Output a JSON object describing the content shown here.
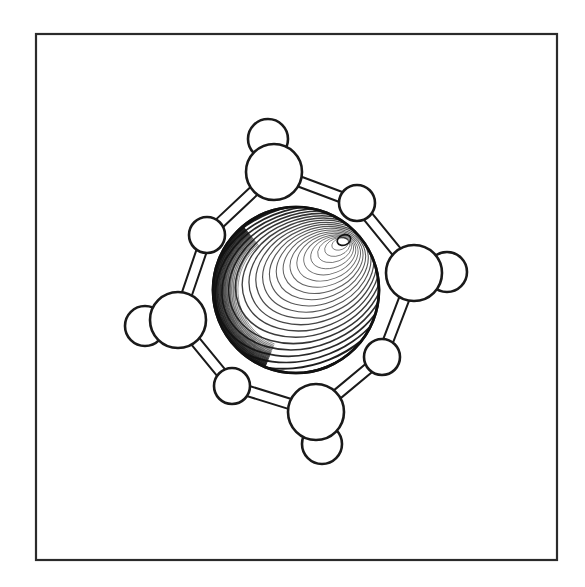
{
  "figure": {
    "kind": "molecular-structure-line-drawing",
    "caption": "",
    "canvas": {
      "width": 585,
      "height": 587,
      "background": "#ffffff"
    },
    "frame": {
      "x": 36,
      "y": 34,
      "width": 521,
      "height": 526,
      "stroke": "#2b2b2b",
      "stroke_width": 2.2,
      "fill": "none"
    },
    "style": {
      "line_color": "#1a1a1a",
      "atom_fill": "#ffffff",
      "atom_stroke_width": 2.6,
      "bond_stroke_width": 2.0,
      "hatch_color": "#111111"
    },
    "central_atom": {
      "label": "central-metal-sphere",
      "cx": 296,
      "cy": 290,
      "r": 83,
      "fill": "#ffffff",
      "stroke": "#111111",
      "stroke_width": 2.6,
      "highlight": {
        "cx": 344,
        "cy": 240,
        "rx": 7,
        "ry": 5
      },
      "shading": {
        "type": "concentric-contour-hatching",
        "rings": 22,
        "tilt_deg": -22,
        "dark_quadrant": "lower-left"
      }
    },
    "ring_atoms": [
      {
        "id": "N-top",
        "type": "large",
        "cx": 274,
        "cy": 172,
        "r": 28
      },
      {
        "id": "O-upper-right",
        "type": "small",
        "cx": 357,
        "cy": 203,
        "r": 18
      },
      {
        "id": "N-right",
        "type": "large",
        "cx": 414,
        "cy": 273,
        "r": 28
      },
      {
        "id": "O-lower-right",
        "type": "small",
        "cx": 382,
        "cy": 357,
        "r": 18
      },
      {
        "id": "N-bottom",
        "type": "large",
        "cx": 316,
        "cy": 412,
        "r": 28
      },
      {
        "id": "O-lower-left",
        "type": "small",
        "cx": 232,
        "cy": 386,
        "r": 18
      },
      {
        "id": "N-left",
        "type": "large",
        "cx": 178,
        "cy": 320,
        "r": 28
      },
      {
        "id": "O-upper-left",
        "type": "small",
        "cx": 207,
        "cy": 235,
        "r": 18
      }
    ],
    "hydrogen_atoms": [
      {
        "id": "H-top",
        "parent": "N-top",
        "cx": 268,
        "cy": 139,
        "r": 20
      },
      {
        "id": "H-right",
        "parent": "N-right",
        "cx": 447,
        "cy": 272,
        "r": 20
      },
      {
        "id": "H-bottom",
        "parent": "N-bottom",
        "cx": 322,
        "cy": 444,
        "r": 20
      },
      {
        "id": "H-left",
        "parent": "N-left",
        "cx": 145,
        "cy": 326,
        "r": 20
      }
    ],
    "bonds": [
      {
        "from": "N-top",
        "to": "O-upper-right",
        "style": "double-line-cylinder"
      },
      {
        "from": "O-upper-right",
        "to": "N-right",
        "style": "double-line-cylinder"
      },
      {
        "from": "N-right",
        "to": "O-lower-right",
        "style": "double-line-cylinder"
      },
      {
        "from": "O-lower-right",
        "to": "N-bottom",
        "style": "double-line-cylinder"
      },
      {
        "from": "N-bottom",
        "to": "O-lower-left",
        "style": "double-line-cylinder"
      },
      {
        "from": "O-lower-left",
        "to": "N-left",
        "style": "double-line-cylinder"
      },
      {
        "from": "N-left",
        "to": "O-upper-left",
        "style": "double-line-cylinder"
      },
      {
        "from": "O-upper-left",
        "to": "N-top",
        "style": "double-line-cylinder"
      }
    ]
  }
}
